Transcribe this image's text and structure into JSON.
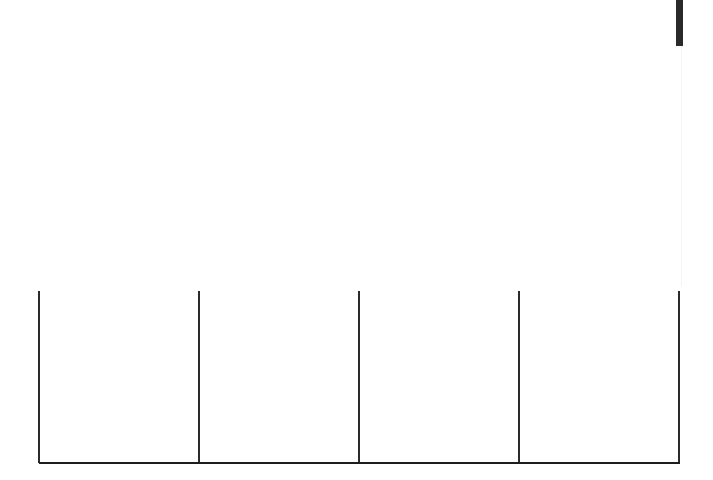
{
  "diagram": {
    "type": "column-frame",
    "column_count": 4,
    "divider_x_positions": [
      39,
      199,
      359,
      519,
      679
    ],
    "divider_top_y": 291,
    "baseline_y": 462,
    "line_color": "#2b2b2b",
    "background_color": "#ffffff",
    "top_marker": {
      "x": 676,
      "width": 7,
      "height": 46,
      "color": "#2a2a2a"
    },
    "columns": [
      {
        "label": ""
      },
      {
        "label": ""
      },
      {
        "label": ""
      },
      {
        "label": ""
      }
    ]
  }
}
